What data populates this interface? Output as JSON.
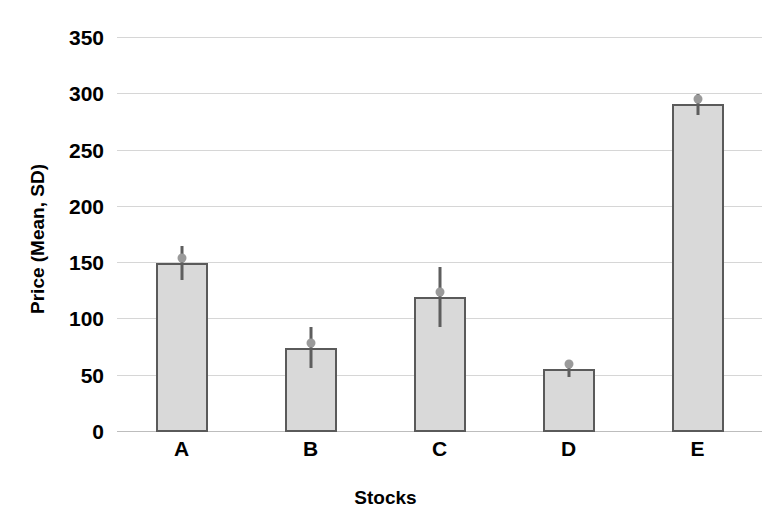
{
  "chart_data": {
    "type": "bar",
    "title": "",
    "xlabel": "Stocks",
    "ylabel": "Price (Mean, SD)",
    "categories": [
      "A",
      "B",
      "C",
      "D",
      "E"
    ],
    "values": [
      150,
      75,
      120,
      56,
      291
    ],
    "errors": [
      15,
      18,
      27,
      7,
      9
    ],
    "series": [
      {
        "name": "Price",
        "values": [
          150,
          75,
          120,
          56,
          291
        ],
        "errors": [
          15,
          18,
          27,
          7,
          9
        ]
      }
    ],
    "ylim": [
      0,
      350
    ],
    "yticks": [
      0,
      50,
      100,
      150,
      200,
      250,
      300,
      350
    ],
    "ytick_labels": [
      "0",
      "50",
      "100",
      "150",
      "200",
      "250",
      "300",
      "350"
    ],
    "xtick_labels": [
      "A",
      "B",
      "C",
      "D",
      "E"
    ],
    "grid": true,
    "legend": false,
    "legend_position": "none",
    "error_bar_style": "vertical-line-no-caps",
    "colors": {
      "bar_fill": "#d9d9d9",
      "bar_border": "#5a5a5a",
      "gridline": "#d6d6d6",
      "axis_line": "#bdbdbd",
      "error_bar": "#5e5e5e",
      "error_marker": "#9a9a9a",
      "text": "#000000",
      "background": "#ffffff"
    }
  }
}
